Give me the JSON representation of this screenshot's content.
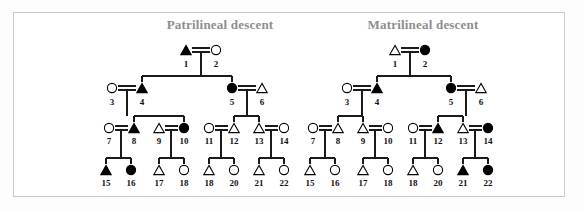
{
  "figure": {
    "background_color": "#ffffff",
    "frame_border_color": "#c9c9c9",
    "line_color": "#1a1a1a",
    "symbol_fill_affected": "#000000",
    "symbol_fill_unaffected": "#ffffff",
    "symbol_stroke": "#000000",
    "title_color": "#8e8e8e"
  },
  "legend_semantics": {
    "triangle": "male",
    "circle": "female",
    "filled": "affected",
    "open": "unaffected",
    "double_line": "mating / marriage",
    "vertical_line": "descent line"
  },
  "panels": [
    {
      "id": "patrilineal",
      "title": "Patrilineal descent",
      "title_x": 220,
      "title_y": 28,
      "individuals": [
        {
          "id": "1",
          "shape": "triangle",
          "filled": true,
          "x": 186,
          "y": 50,
          "label_x": 186,
          "label_y": 67
        },
        {
          "id": "2",
          "shape": "circle",
          "filled": false,
          "x": 216,
          "y": 50,
          "label_x": 216,
          "label_y": 67
        },
        {
          "id": "3",
          "shape": "circle",
          "filled": false,
          "x": 112,
          "y": 88,
          "label_x": 112,
          "label_y": 105
        },
        {
          "id": "4",
          "shape": "triangle",
          "filled": true,
          "x": 142,
          "y": 88,
          "label_x": 142,
          "label_y": 105
        },
        {
          "id": "5",
          "shape": "circle",
          "filled": true,
          "x": 232,
          "y": 88,
          "label_x": 232,
          "label_y": 105
        },
        {
          "id": "6",
          "shape": "triangle",
          "filled": false,
          "x": 262,
          "y": 88,
          "label_x": 262,
          "label_y": 105
        },
        {
          "id": "7",
          "shape": "circle",
          "filled": false,
          "x": 109,
          "y": 128,
          "label_x": 109,
          "label_y": 144
        },
        {
          "id": "8",
          "shape": "triangle",
          "filled": true,
          "x": 134,
          "y": 128,
          "label_x": 134,
          "label_y": 144
        },
        {
          "id": "9",
          "shape": "triangle",
          "filled": false,
          "x": 159,
          "y": 128,
          "label_x": 159,
          "label_y": 144
        },
        {
          "id": "10",
          "shape": "circle",
          "filled": true,
          "x": 184,
          "y": 128,
          "label_x": 184,
          "label_y": 144
        },
        {
          "id": "11",
          "shape": "circle",
          "filled": false,
          "x": 209,
          "y": 128,
          "label_x": 209,
          "label_y": 144
        },
        {
          "id": "12",
          "shape": "triangle",
          "filled": false,
          "x": 234,
          "y": 128,
          "label_x": 234,
          "label_y": 144
        },
        {
          "id": "13",
          "shape": "triangle",
          "filled": false,
          "x": 259,
          "y": 128,
          "label_x": 259,
          "label_y": 144
        },
        {
          "id": "14",
          "shape": "circle",
          "filled": false,
          "x": 284,
          "y": 128,
          "label_x": 284,
          "label_y": 144
        },
        {
          "id": "15",
          "shape": "triangle",
          "filled": true,
          "x": 106,
          "y": 170,
          "label_x": 106,
          "label_y": 186
        },
        {
          "id": "16",
          "shape": "circle",
          "filled": true,
          "x": 131,
          "y": 170,
          "label_x": 131,
          "label_y": 186
        },
        {
          "id": "17",
          "shape": "triangle",
          "filled": false,
          "x": 159,
          "y": 170,
          "label_x": 159,
          "label_y": 186
        },
        {
          "id": "18",
          "shape": "circle",
          "filled": false,
          "x": 184,
          "y": 170,
          "label_x": 184,
          "label_y": 186
        },
        {
          "id": "18b",
          "shape": "triangle",
          "filled": false,
          "x": 209,
          "y": 170,
          "label": "18",
          "label_x": 209,
          "label_y": 186
        },
        {
          "id": "20",
          "shape": "circle",
          "filled": false,
          "x": 234,
          "y": 170,
          "label_x": 234,
          "label_y": 186
        },
        {
          "id": "21",
          "shape": "triangle",
          "filled": false,
          "x": 259,
          "y": 170,
          "label_x": 259,
          "label_y": 186
        },
        {
          "id": "22",
          "shape": "circle",
          "filled": false,
          "x": 284,
          "y": 170,
          "label_x": 284,
          "label_y": 186
        }
      ],
      "matings": [
        {
          "left_x": 186,
          "right_x": 216,
          "y": 50,
          "drop_x": 201,
          "drop_to_y": 76
        },
        {
          "left_x": 112,
          "right_x": 142,
          "y": 88,
          "drop_x": 127,
          "drop_to_y": 116
        },
        {
          "left_x": 232,
          "right_x": 262,
          "y": 88,
          "drop_x": 247,
          "drop_to_y": 116
        },
        {
          "left_x": 109,
          "right_x": 134,
          "y": 128,
          "drop_x": 121,
          "drop_to_y": 158
        },
        {
          "left_x": 159,
          "right_x": 184,
          "y": 128,
          "drop_x": 171,
          "drop_to_y": 158
        },
        {
          "left_x": 209,
          "right_x": 234,
          "y": 128,
          "drop_x": 221,
          "drop_to_y": 158
        },
        {
          "left_x": 259,
          "right_x": 284,
          "y": 128,
          "drop_x": 271,
          "drop_to_y": 158
        }
      ],
      "sibships": [
        {
          "parent_drop_x": 201,
          "bar_y": 76,
          "child_xs": [
            142,
            232
          ],
          "child_top_y": 82
        },
        {
          "parent_drop_x": 127,
          "bar_y": 116,
          "child_xs": [
            134,
            184
          ],
          "child_top_y": 122
        },
        {
          "parent_drop_x": 247,
          "bar_y": 116,
          "child_xs": [
            234,
            259
          ],
          "child_top_y": 122
        },
        {
          "parent_drop_x": 121,
          "bar_y": 158,
          "child_xs": [
            106,
            131
          ],
          "child_top_y": 164
        },
        {
          "parent_drop_x": 171,
          "bar_y": 158,
          "child_xs": [
            159,
            184
          ],
          "child_top_y": 164
        },
        {
          "parent_drop_x": 221,
          "bar_y": 158,
          "child_xs": [
            209,
            234
          ],
          "child_top_y": 164
        },
        {
          "parent_drop_x": 271,
          "bar_y": 158,
          "child_xs": [
            259,
            284
          ],
          "child_top_y": 164
        }
      ]
    },
    {
      "id": "matrilineal",
      "title": "Matrilineal descent",
      "title_x": 423,
      "title_y": 28,
      "individuals": [
        {
          "id": "1",
          "shape": "triangle",
          "filled": false,
          "x": 395,
          "y": 50,
          "label_x": 395,
          "label_y": 67
        },
        {
          "id": "2",
          "shape": "circle",
          "filled": true,
          "x": 425,
          "y": 50,
          "label_x": 425,
          "label_y": 67
        },
        {
          "id": "3",
          "shape": "circle",
          "filled": false,
          "x": 347,
          "y": 88,
          "label_x": 347,
          "label_y": 105
        },
        {
          "id": "4",
          "shape": "triangle",
          "filled": true,
          "x": 377,
          "y": 88,
          "label_x": 377,
          "label_y": 105
        },
        {
          "id": "5",
          "shape": "circle",
          "filled": true,
          "x": 451,
          "y": 88,
          "label_x": 451,
          "label_y": 105
        },
        {
          "id": "6",
          "shape": "triangle",
          "filled": false,
          "x": 481,
          "y": 88,
          "label_x": 481,
          "label_y": 105
        },
        {
          "id": "7",
          "shape": "circle",
          "filled": false,
          "x": 313,
          "y": 128,
          "label_x": 313,
          "label_y": 144
        },
        {
          "id": "8",
          "shape": "triangle",
          "filled": false,
          "x": 338,
          "y": 128,
          "label_x": 338,
          "label_y": 144
        },
        {
          "id": "9",
          "shape": "triangle",
          "filled": false,
          "x": 363,
          "y": 128,
          "label_x": 363,
          "label_y": 144
        },
        {
          "id": "10",
          "shape": "circle",
          "filled": false,
          "x": 388,
          "y": 128,
          "label_x": 388,
          "label_y": 144
        },
        {
          "id": "11",
          "shape": "circle",
          "filled": false,
          "x": 413,
          "y": 128,
          "label_x": 413,
          "label_y": 144
        },
        {
          "id": "12",
          "shape": "triangle",
          "filled": true,
          "x": 438,
          "y": 128,
          "label_x": 438,
          "label_y": 144
        },
        {
          "id": "13",
          "shape": "triangle",
          "filled": false,
          "x": 463,
          "y": 128,
          "label_x": 463,
          "label_y": 144
        },
        {
          "id": "14",
          "shape": "circle",
          "filled": true,
          "x": 488,
          "y": 128,
          "label_x": 488,
          "label_y": 144
        },
        {
          "id": "15",
          "shape": "triangle",
          "filled": false,
          "x": 310,
          "y": 170,
          "label_x": 310,
          "label_y": 186
        },
        {
          "id": "16",
          "shape": "circle",
          "filled": false,
          "x": 335,
          "y": 170,
          "label_x": 335,
          "label_y": 186
        },
        {
          "id": "17",
          "shape": "triangle",
          "filled": false,
          "x": 363,
          "y": 170,
          "label_x": 363,
          "label_y": 186
        },
        {
          "id": "18",
          "shape": "circle",
          "filled": false,
          "x": 388,
          "y": 170,
          "label_x": 388,
          "label_y": 186
        },
        {
          "id": "18b",
          "shape": "triangle",
          "filled": false,
          "x": 413,
          "y": 170,
          "label": "18",
          "label_x": 413,
          "label_y": 186
        },
        {
          "id": "20",
          "shape": "circle",
          "filled": false,
          "x": 438,
          "y": 170,
          "label_x": 438,
          "label_y": 186
        },
        {
          "id": "21",
          "shape": "triangle",
          "filled": true,
          "x": 463,
          "y": 170,
          "label_x": 463,
          "label_y": 186
        },
        {
          "id": "22",
          "shape": "circle",
          "filled": true,
          "x": 488,
          "y": 170,
          "label_x": 488,
          "label_y": 186
        }
      ],
      "matings": [
        {
          "left_x": 395,
          "right_x": 425,
          "y": 50,
          "drop_x": 410,
          "drop_to_y": 76
        },
        {
          "left_x": 347,
          "right_x": 377,
          "y": 88,
          "drop_x": 362,
          "drop_to_y": 116
        },
        {
          "left_x": 451,
          "right_x": 481,
          "y": 88,
          "drop_x": 466,
          "drop_to_y": 116
        },
        {
          "left_x": 313,
          "right_x": 338,
          "y": 128,
          "drop_x": 325,
          "drop_to_y": 158
        },
        {
          "left_x": 363,
          "right_x": 388,
          "y": 128,
          "drop_x": 375,
          "drop_to_y": 158
        },
        {
          "left_x": 413,
          "right_x": 438,
          "y": 128,
          "drop_x": 425,
          "drop_to_y": 158
        },
        {
          "left_x": 463,
          "right_x": 488,
          "y": 128,
          "drop_x": 475,
          "drop_to_y": 158
        }
      ],
      "sibships": [
        {
          "parent_drop_x": 410,
          "bar_y": 76,
          "child_xs": [
            377,
            451
          ],
          "child_top_y": 82
        },
        {
          "parent_drop_x": 362,
          "bar_y": 116,
          "child_xs": [
            338,
            363
          ],
          "child_top_y": 122
        },
        {
          "parent_drop_x": 466,
          "bar_y": 116,
          "child_xs": [
            438,
            463
          ],
          "child_top_y": 122
        },
        {
          "parent_drop_x": 325,
          "bar_y": 158,
          "child_xs": [
            310,
            335
          ],
          "child_top_y": 164
        },
        {
          "parent_drop_x": 375,
          "bar_y": 158,
          "child_xs": [
            363,
            388
          ],
          "child_top_y": 164
        },
        {
          "parent_drop_x": 425,
          "bar_y": 158,
          "child_xs": [
            413,
            438
          ],
          "child_top_y": 164
        },
        {
          "parent_drop_x": 475,
          "bar_y": 158,
          "child_xs": [
            463,
            488
          ],
          "child_top_y": 164
        }
      ]
    }
  ]
}
